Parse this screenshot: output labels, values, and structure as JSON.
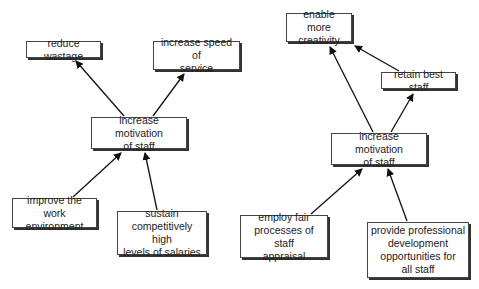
{
  "diagrams": [
    {
      "center": {
        "label": "increase motivation of staff",
        "lines": [
          "increase motivation",
          "of staff"
        ]
      },
      "outcomes": [
        {
          "label": "reduce wastage"
        },
        {
          "label": "increase speed of service",
          "lines": [
            "increase speed of",
            "service"
          ]
        }
      ],
      "drivers": [
        {
          "label": "improve the work environment",
          "lines": [
            "improve the work",
            "environment"
          ]
        },
        {
          "label": "sustain competitively high levels of salaries",
          "lines": [
            "sustain",
            "competitively high",
            "levels of salaries"
          ]
        }
      ]
    },
    {
      "center": {
        "label": "increase motivation of staff",
        "lines": [
          "increase motivation",
          "of staff"
        ]
      },
      "outcomes": [
        {
          "label": "enable more creativity",
          "lines": [
            "enable more",
            "creativity"
          ]
        },
        {
          "label": "retain best staff"
        }
      ],
      "drivers": [
        {
          "label": "employ fair processes of staff appraisal",
          "lines": [
            "employ fair",
            "processes of staff",
            "appraisal"
          ]
        },
        {
          "label": "provide professional development opportunities for all staff",
          "lines": [
            "provide professional",
            "development",
            "opportunities for",
            "all staff"
          ]
        }
      ]
    }
  ]
}
